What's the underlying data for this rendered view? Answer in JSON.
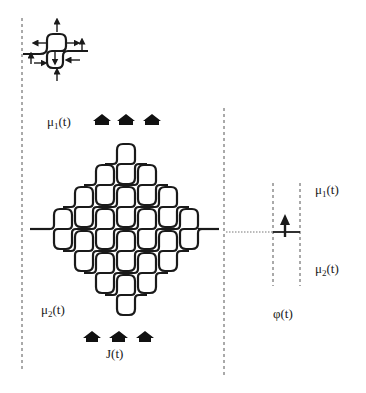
{
  "figure": {
    "labels": {
      "mu1_top": {
        "base": "μ",
        "sub": "1",
        "tail": "(t)"
      },
      "mu2_left": {
        "base": "μ",
        "sub": "2",
        "tail": "(t)"
      },
      "current": "J(t)",
      "mu1_right": {
        "base": "μ",
        "sub": "1",
        "tail": "(t)"
      },
      "mu2_right": {
        "base": "μ",
        "sub": "2",
        "tail": "(t)"
      },
      "phase": "φ(t)"
    },
    "icons": {
      "cell_unit": "s-shaped-junction-cell-with-force-arrows",
      "top_arrows": [
        "up-arrow",
        "up-arrow",
        "up-arrow"
      ],
      "bottom_arrows": [
        "up-arrow",
        "up-arrow",
        "up-arrow"
      ],
      "phase_arrow": "up-arrow"
    },
    "colors": {
      "ink": "#1a1a1a",
      "background": "#ffffff",
      "dashed": "#555555"
    }
  }
}
